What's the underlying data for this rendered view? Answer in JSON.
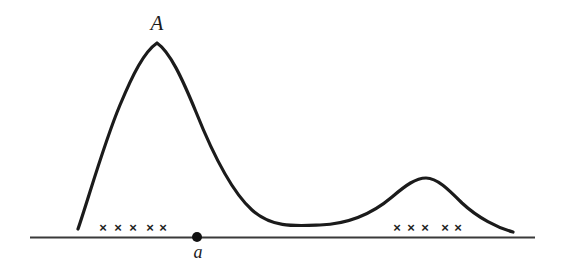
{
  "figure": {
    "kind": "hand-drawn-mathematical-curve-diagram",
    "background_color": "#ffffff",
    "ink_color": "#1b1b1b",
    "axis_color": "#3a3a3a",
    "labels": {
      "peak_label": "A",
      "point_label": "a"
    },
    "point_marker": {
      "name": "point-a-dot",
      "x": 197,
      "y": 237,
      "radius": 5,
      "color": "#111111"
    },
    "axis": {
      "y": 237,
      "x_start": 30,
      "x_end": 535,
      "stroke_width": 2
    },
    "curve": {
      "stroke_width": 3.2,
      "path": "M 78 229 C 88 200 104 143 120 105 C 133 74 144 52 157 43 C 170 52 182 78 196 112 C 214 157 232 192 252 210 C 272 228 295 226 320 225 C 348 224 372 214 392 197 C 406 185 416 178 426 178 C 437 178 448 189 462 203 C 478 218 498 228 513 232",
      "key_points": [
        {
          "name": "left-tail-start",
          "x": 78,
          "y": 229
        },
        {
          "name": "primary-peak-A",
          "x": 157,
          "y": 43
        },
        {
          "name": "trough",
          "x": 320,
          "y": 225
        },
        {
          "name": "secondary-peak",
          "x": 426,
          "y": 178
        },
        {
          "name": "right-tail-end",
          "x": 513,
          "y": 232
        }
      ]
    },
    "cross_marks": {
      "glyph": "×",
      "y": 227,
      "left_cluster": [
        103,
        118,
        133,
        150,
        163
      ],
      "right_cluster": [
        397,
        411,
        425,
        445,
        458
      ]
    }
  }
}
